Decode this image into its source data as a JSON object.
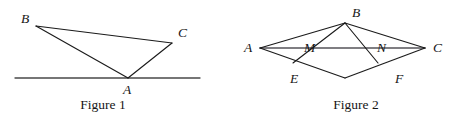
{
  "page": {
    "width": 456,
    "height": 121,
    "background": "#ffffff",
    "ink_color": "#1b1b1b",
    "axis_color": "#55545a"
  },
  "figures": [
    {
      "id": "figure-1",
      "caption": "Figure 1",
      "caption_pos": {
        "x": 103,
        "y": 100
      },
      "description": "Triangle ABC with vertex A lying on a horizontal base line",
      "points": [
        {
          "name": "B",
          "label": "B",
          "x": 36,
          "y": 26,
          "label_x": 21,
          "label_y": 12
        },
        {
          "name": "C",
          "label": "C",
          "x": 172,
          "y": 43,
          "label_x": 178,
          "label_y": 26
        },
        {
          "name": "A",
          "label": "A",
          "x": 128,
          "y": 78,
          "label_x": 123,
          "label_y": 83
        }
      ],
      "segments": [
        {
          "name": "segment-BC",
          "from": "B",
          "to": "C"
        },
        {
          "name": "segment-BA",
          "from": "B",
          "to": "A"
        },
        {
          "name": "segment-CA",
          "from": "C",
          "to": "A"
        }
      ],
      "baseline": {
        "name": "base-line",
        "x1": 15,
        "y1": 78,
        "x2": 200,
        "y2": 78
      }
    },
    {
      "id": "figure-2",
      "caption": "Figure 2",
      "caption_pos": {
        "x": 359,
        "y": 100
      },
      "description": "Kite / rhombus A B C D with diagonal AC and cevians from B crossing AC at M and N",
      "points": [
        {
          "name": "A",
          "label": "A",
          "x": 32,
          "y": 48,
          "label_x": 16,
          "label_y": 41
        },
        {
          "name": "B",
          "label": "B",
          "x": 117,
          "y": 23,
          "label_x": 124,
          "label_y": 6
        },
        {
          "name": "C",
          "label": "C",
          "x": 197,
          "y": 48,
          "label_x": 205,
          "label_y": 41
        },
        {
          "name": "D",
          "label": "",
          "x": 117,
          "y": 78,
          "label_x": 0,
          "label_y": 0
        },
        {
          "name": "M",
          "label": "M",
          "x": 82,
          "y": 48,
          "label_x": 76,
          "label_y": 42
        },
        {
          "name": "N",
          "label": "N",
          "x": 155,
          "y": 48,
          "label_x": 149,
          "label_y": 42
        },
        {
          "name": "E",
          "label": "E",
          "x": 65,
          "y": 63,
          "label_x": 62,
          "label_y": 72
        },
        {
          "name": "F",
          "label": "F",
          "x": 150,
          "y": 63,
          "label_x": 167,
          "label_y": 72
        }
      ],
      "segments": [
        {
          "name": "segment-AB",
          "from": "A",
          "to": "B"
        },
        {
          "name": "segment-BC",
          "from": "B",
          "to": "C"
        },
        {
          "name": "segment-AD",
          "from": "A",
          "to": "D"
        },
        {
          "name": "segment-DC",
          "from": "D",
          "to": "C"
        },
        {
          "name": "segment-BE",
          "from": "B",
          "to": "E"
        },
        {
          "name": "segment-BF",
          "from": "B",
          "to": "F"
        }
      ],
      "diagonal": {
        "name": "diagonal-AC",
        "x1": 32,
        "y1": 48,
        "x2": 197,
        "y2": 48
      }
    }
  ]
}
